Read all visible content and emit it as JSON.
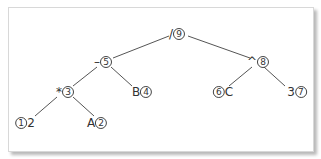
{
  "diagram": {
    "type": "expression-tree",
    "nodes": [
      {
        "id": "n9",
        "symbol": "/",
        "order": "9",
        "order_position": "right",
        "x": 177,
        "y": 34
      },
      {
        "id": "n5",
        "symbol": "–",
        "order": "5",
        "order_position": "right",
        "x": 103,
        "y": 62
      },
      {
        "id": "n8",
        "symbol": "^",
        "order": "8",
        "order_position": "right",
        "x": 258,
        "y": 62
      },
      {
        "id": "n3",
        "symbol": "*",
        "order": "3",
        "order_position": "right",
        "x": 65,
        "y": 92
      },
      {
        "id": "n4",
        "symbol": "B",
        "order": "4",
        "order_position": "right",
        "x": 142,
        "y": 92
      },
      {
        "id": "n6",
        "symbol": "C",
        "order": "6",
        "order_position": "left",
        "x": 223,
        "y": 92
      },
      {
        "id": "n7",
        "symbol": "3",
        "order": "7",
        "order_position": "right",
        "x": 297,
        "y": 92
      },
      {
        "id": "n1",
        "symbol": "2",
        "order": "1",
        "order_position": "left",
        "x": 25,
        "y": 123
      },
      {
        "id": "n2",
        "symbol": "A",
        "order": "2",
        "order_position": "right",
        "x": 97,
        "y": 123
      }
    ],
    "edges": [
      {
        "from": "n9",
        "to": "n5"
      },
      {
        "from": "n9",
        "to": "n8"
      },
      {
        "from": "n5",
        "to": "n3"
      },
      {
        "from": "n5",
        "to": "n4"
      },
      {
        "from": "n8",
        "to": "n6"
      },
      {
        "from": "n8",
        "to": "n7"
      },
      {
        "from": "n3",
        "to": "n1"
      },
      {
        "from": "n3",
        "to": "n2"
      }
    ]
  },
  "labels": {
    "n9": {
      "sym": "/",
      "num": "9"
    },
    "n5": {
      "sym": "–",
      "num": "5"
    },
    "n8": {
      "sym": "^",
      "num": "8"
    },
    "n3": {
      "sym": "*",
      "num": "3"
    },
    "n4": {
      "sym": "B",
      "num": "4"
    },
    "n6": {
      "sym": "C",
      "num": "6"
    },
    "n7": {
      "sym": "3",
      "num": "7"
    },
    "n1": {
      "sym": "2",
      "num": "1"
    },
    "n2": {
      "sym": "A",
      "num": "2"
    }
  }
}
